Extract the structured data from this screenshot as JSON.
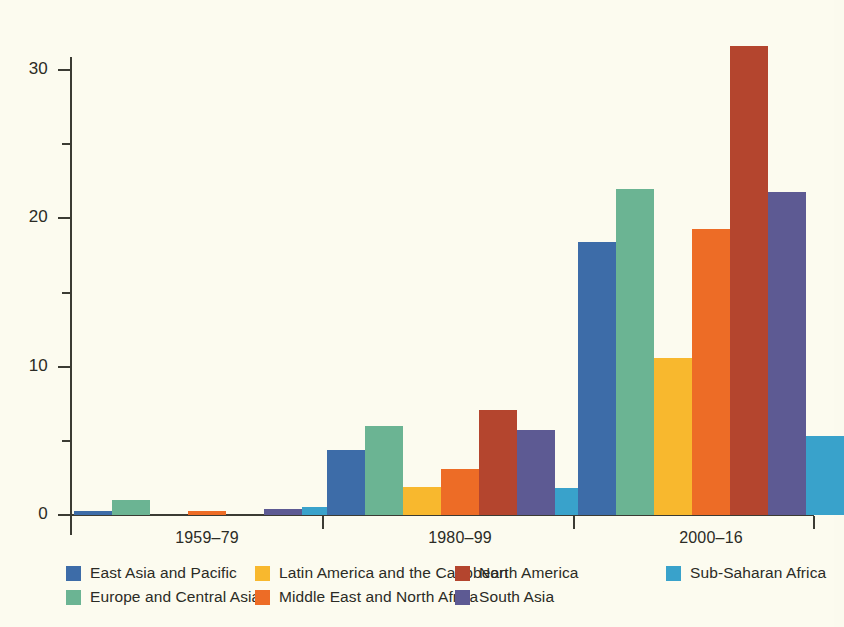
{
  "chart_data": {
    "type": "bar",
    "title": "",
    "subtitle": "",
    "xlabel": "",
    "ylabel": "",
    "categories": [
      "1959–79",
      "1980–99",
      "2000–16"
    ],
    "ylim": [
      0,
      34
    ],
    "yticks": [
      0,
      10,
      20,
      30
    ],
    "ytick_labels": [
      "0",
      "10",
      "20",
      "30"
    ],
    "yminor_step": 5,
    "grid": false,
    "legend_position": "bottom",
    "series": [
      {
        "name": "East Asia and Pacific",
        "color": "#3d6ca8",
        "values": [
          0.3,
          4.4,
          18.4
        ]
      },
      {
        "name": "Europe and Central Asia",
        "color": "#6bb493",
        "values": [
          1.0,
          6.0,
          22.0
        ]
      },
      {
        "name": "Latin America and the Caribbean",
        "color": "#f8b82e",
        "values": [
          0.0,
          1.9,
          10.6
        ]
      },
      {
        "name": "Middle East and North Africa",
        "color": "#ed6c26",
        "values": [
          0.3,
          3.1,
          19.3
        ]
      },
      {
        "name": "North America",
        "color": "#b4452e",
        "values": [
          0.0,
          7.1,
          31.6
        ]
      },
      {
        "name": "South Asia",
        "color": "#5d5a93",
        "values": [
          0.4,
          5.7,
          21.8
        ]
      },
      {
        "name": "Sub-Saharan Africa",
        "color": "#39a2cb",
        "values": [
          0.55,
          1.8,
          5.3
        ]
      }
    ]
  },
  "axis": {
    "y_tick_labels": [
      "0",
      "10",
      "20",
      "30"
    ],
    "x_group_labels": [
      "1959–79",
      "1980–99",
      "2000–16"
    ]
  },
  "legend": {
    "entries": [
      {
        "label": "East Asia and Pacific",
        "color": "#3d6ca8"
      },
      {
        "label": "Latin America and the Caribbean",
        "color": "#f8b82e"
      },
      {
        "label": "North America",
        "color": "#b4452e"
      },
      {
        "label": "Sub-Saharan Africa",
        "color": "#39a2cb"
      },
      {
        "label": "Europe and Central Asia",
        "color": "#6bb493"
      },
      {
        "label": "Middle East and North Africa",
        "color": "#ed6c26"
      },
      {
        "label": "South Asia",
        "color": "#5d5a93"
      }
    ]
  },
  "colors": {
    "background": "#fcfbef",
    "axis": "#3b3b33",
    "text": "#2b2b25"
  }
}
